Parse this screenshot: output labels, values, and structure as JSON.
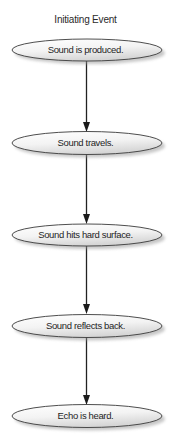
{
  "diagram": {
    "title": "Initiating Event",
    "type": "vertical flowchart",
    "nodes": [
      {
        "id": "n1",
        "label": "Sound is produced.",
        "shape": "ellipse"
      },
      {
        "id": "n2",
        "label": "Sound travels.",
        "shape": "ellipse"
      },
      {
        "id": "n3",
        "label": "Sound hits hard surface.",
        "shape": "ellipse"
      },
      {
        "id": "n4",
        "label": "Sound reflects back.",
        "shape": "ellipse"
      },
      {
        "id": "n5",
        "label": "Echo is heard.",
        "shape": "ellipse"
      }
    ],
    "edges": [
      {
        "from": "n1",
        "to": "n2"
      },
      {
        "from": "n2",
        "to": "n3"
      },
      {
        "from": "n3",
        "to": "n4"
      },
      {
        "from": "n4",
        "to": "n5"
      }
    ],
    "colors": {
      "outline": "#3a3a3a",
      "fill_light": "#ffffff",
      "fill_dark": "#d9d9d9",
      "arrow": "#222222",
      "shadow": "#bdbdbd"
    }
  }
}
